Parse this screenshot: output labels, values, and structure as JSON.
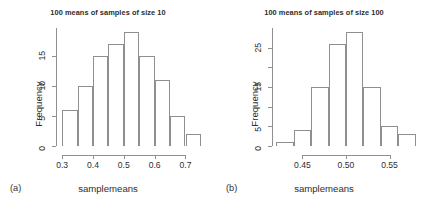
{
  "figure": {
    "background": "#ffffff",
    "axis_color": "#8f8f8f",
    "text_color": "#2e2e2e"
  },
  "panels": [
    {
      "tag": "(a)",
      "title": "100 means of samples of size 10",
      "xlabel": "samplemeans",
      "ylabel": "Frequency"
    },
    {
      "tag": "(b)",
      "title": "100 means of samples of size 100",
      "xlabel": "samplemeans",
      "ylabel": "Frequency"
    }
  ],
  "chart_data": [
    {
      "type": "bar",
      "title": "100 means of samples of size 10",
      "xlabel": "samplemeans",
      "ylabel": "Frequency",
      "panel": "(a)",
      "bin_width": 0.05,
      "bin_edges": [
        0.3,
        0.35,
        0.4,
        0.45,
        0.5,
        0.55,
        0.6,
        0.65,
        0.7,
        0.75
      ],
      "categories": [
        "0.30-0.35",
        "0.35-0.40",
        "0.40-0.45",
        "0.45-0.50",
        "0.50-0.55",
        "0.55-0.60",
        "0.60-0.65",
        "0.65-0.70",
        "0.70-0.75"
      ],
      "values": [
        6,
        10,
        15,
        17,
        19,
        15,
        11,
        5,
        2
      ],
      "total": 100,
      "xlim": [
        0.28,
        0.76
      ],
      "ylim": [
        0,
        19
      ],
      "xticks": [
        0.3,
        0.4,
        0.5,
        0.6,
        0.7
      ],
      "xticklabels": [
        "0.3",
        "0.4",
        "0.5",
        "0.6",
        "0.7"
      ],
      "yticks": [
        0,
        5,
        10,
        15
      ],
      "yticklabels": [
        "0",
        "5",
        "10",
        "15"
      ],
      "grid": false,
      "legend": "none"
    },
    {
      "type": "bar",
      "title": "100 means of samples of size 100",
      "xlabel": "samplemeans",
      "ylabel": "Frequency",
      "panel": "(b)",
      "bin_width": 0.02,
      "bin_edges": [
        0.42,
        0.44,
        0.46,
        0.48,
        0.5,
        0.52,
        0.54,
        0.56,
        0.58
      ],
      "categories": [
        "0.42-0.44",
        "0.44-0.46",
        "0.46-0.48",
        "0.48-0.50",
        "0.50-0.52",
        "0.52-0.54",
        "0.54-0.56",
        "0.56-0.58"
      ],
      "values": [
        1,
        4,
        15,
        26,
        29,
        15,
        5,
        3
      ],
      "total": 98,
      "xlim": [
        0.415,
        0.585
      ],
      "ylim": [
        0,
        29
      ],
      "xticks": [
        0.45,
        0.5,
        0.55
      ],
      "xticklabels": [
        "0.45",
        "0.50",
        "0.55"
      ],
      "yticks": [
        0,
        5,
        10,
        15,
        20,
        25
      ],
      "yticklabels": [
        "0",
        "5",
        "",
        "15",
        "",
        "25"
      ],
      "grid": false,
      "legend": "none"
    }
  ]
}
